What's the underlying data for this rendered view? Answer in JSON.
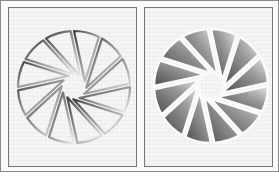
{
  "figure": {
    "panels": [
      {
        "id": "left",
        "description": "pinwheel aperture shape with embossed outline (edges only)",
        "blade_count": 12,
        "style": "outline-emboss",
        "center": [
          65,
          79
        ],
        "radius": 56
      },
      {
        "id": "right",
        "description": "pinwheel aperture shape with solid gray gradient blades",
        "blade_count": 12,
        "style": "solid-gradient",
        "center": [
          66,
          78
        ],
        "radius": 57
      }
    ],
    "colors": {
      "border": "#777777",
      "blade_dark": "#555555",
      "blade_light": "#e8e8e8",
      "background": "#f6f6f6"
    }
  }
}
